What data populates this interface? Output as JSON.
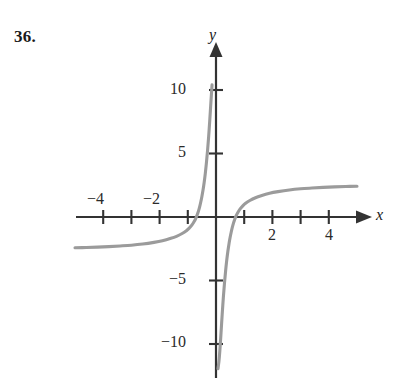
{
  "figure": {
    "problem_number": "36.",
    "axis_labels": {
      "x": "x",
      "y": "y"
    },
    "colors": {
      "axis": "#333333",
      "curve": "#9b9b9b",
      "text": "#1a1a1a",
      "background": "#ffffff"
    }
  },
  "chart_data": {
    "type": "line",
    "title": "",
    "subtitle": "",
    "xlabel": "x",
    "ylabel": "y",
    "xlim": [
      -5,
      5
    ],
    "ylim": [
      -11.5,
      12
    ],
    "grid": false,
    "legend": null,
    "x_ticks": [
      -4,
      -3,
      -2,
      -1,
      1,
      2,
      3,
      4
    ],
    "x_tick_labels": [
      "-4",
      "",
      "-2",
      "",
      "",
      "2",
      "",
      "4"
    ],
    "y_ticks": [
      10,
      5,
      -5,
      -10
    ],
    "y_tick_labels": [
      "10",
      "5",
      "-5",
      "-10"
    ],
    "x_tick_label_texts": [
      "−4",
      "−2",
      "2",
      "4"
    ],
    "y_tick_label_texts": [
      "10",
      "5",
      "−5",
      "−10"
    ],
    "asymptotes": {
      "vertical": [
        0
      ],
      "horizontal": [
        2.5,
        -2.5
      ]
    },
    "series": [
      {
        "name": "left-branch",
        "comment": "x < 0 branch: rises from y approx -2.5 far left, crosses near x=-0.55, steeply up to +12 as x approaches 0 from the left",
        "x": [
          -5.0,
          -4.6,
          -4.2,
          -3.8,
          -3.4,
          -3.0,
          -2.6,
          -2.2,
          -1.9,
          -1.6,
          -1.4,
          -1.2,
          -1.05,
          -0.95,
          -0.85,
          -0.78,
          -0.72,
          -0.66,
          -0.62,
          -0.58,
          -0.54,
          -0.5,
          -0.46,
          -0.42,
          -0.38,
          -0.34,
          -0.3,
          -0.26,
          -0.22,
          -0.19,
          -0.16,
          -0.14,
          -0.12,
          -0.1,
          -0.085,
          -0.07
        ],
        "y": [
          -2.42,
          -2.4,
          -2.37,
          -2.33,
          -2.28,
          -2.22,
          -2.13,
          -2.0,
          -1.87,
          -1.68,
          -1.52,
          -1.3,
          -1.08,
          -0.88,
          -0.62,
          -0.38,
          -0.12,
          0.22,
          0.48,
          0.8,
          1.18,
          1.62,
          2.12,
          2.72,
          3.42,
          4.26,
          5.22,
          6.35,
          7.65,
          8.7,
          9.75,
          10.4,
          11.0,
          11.45,
          11.7,
          11.95
        ]
      },
      {
        "name": "right-branch",
        "comment": "x > 0 branch: comes up from -11.5 near x=0+, crosses x-axis near x=0.55, flattens toward y approx 2.5",
        "x": [
          0.07,
          0.085,
          0.1,
          0.12,
          0.14,
          0.16,
          0.19,
          0.22,
          0.26,
          0.3,
          0.34,
          0.38,
          0.42,
          0.46,
          0.5,
          0.54,
          0.58,
          0.62,
          0.66,
          0.72,
          0.78,
          0.85,
          0.95,
          1.05,
          1.2,
          1.4,
          1.6,
          1.9,
          2.2,
          2.6,
          3.0,
          3.4,
          3.8,
          4.2,
          4.6,
          5.0
        ],
        "y": [
          -11.95,
          -11.7,
          -11.45,
          -11.0,
          -10.4,
          -9.75,
          -8.7,
          -7.65,
          -6.35,
          -5.22,
          -4.26,
          -3.42,
          -2.72,
          -2.12,
          -1.62,
          -1.18,
          -0.8,
          -0.48,
          -0.22,
          0.12,
          0.38,
          0.62,
          0.88,
          1.08,
          1.3,
          1.52,
          1.68,
          1.87,
          2.0,
          2.13,
          2.22,
          2.28,
          2.33,
          2.37,
          2.4,
          2.42
        ]
      }
    ]
  }
}
